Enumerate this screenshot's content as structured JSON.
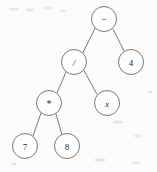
{
  "figure": {
    "name": "expression-tree",
    "type": "binary-expression-tree",
    "expression": "7 * 8 / x - 4",
    "width": 157,
    "height": 172,
    "background_color": "#fbfbfa",
    "stroke_color": "#6b6b6b",
    "text_color": "#2b2b2b",
    "node_fill": "#fdfdfc",
    "node_radius": 12.5
  },
  "nodes": [
    {
      "id": "n0",
      "label": "−",
      "kind": "operator",
      "style": "op",
      "cx": 104,
      "cy": 19,
      "r": 12.5
    },
    {
      "id": "n1",
      "label": "/",
      "kind": "operator",
      "style": "italic",
      "cx": 74,
      "cy": 62,
      "r": 12.5
    },
    {
      "id": "n2",
      "label": "4",
      "kind": "operand",
      "style": "plain",
      "cx": 131,
      "cy": 62,
      "r": 12.5
    },
    {
      "id": "n3",
      "label": "*",
      "kind": "operator",
      "style": "op",
      "cx": 49,
      "cy": 103,
      "r": 12.5
    },
    {
      "id": "n4",
      "label": "x",
      "kind": "variable",
      "style": "italic",
      "cx": 107,
      "cy": 103,
      "r": 12.5
    },
    {
      "id": "n5",
      "label": "7",
      "kind": "operand",
      "style": "plain",
      "cx": 25,
      "cy": 146,
      "r": 12.5
    },
    {
      "id": "n6",
      "label": "8",
      "kind": "operand",
      "style": "plain",
      "cx": 67,
      "cy": 146,
      "r": 12.5
    }
  ],
  "edges": [
    {
      "id": "e0",
      "from": "n0",
      "to": "n1",
      "x1": 95.5,
      "y1": 27.5,
      "x2": 82.5,
      "y2": 53.5
    },
    {
      "id": "e1",
      "from": "n0",
      "to": "n2",
      "x1": 113,
      "y1": 29,
      "x2": 124,
      "y2": 51
    },
    {
      "id": "e2",
      "from": "n1",
      "to": "n3",
      "x1": 66,
      "y1": 72,
      "x2": 57,
      "y2": 93
    },
    {
      "id": "e3",
      "from": "n1",
      "to": "n4",
      "x1": 84,
      "y1": 70.5,
      "x2": 97,
      "y2": 94.5
    },
    {
      "id": "e4",
      "from": "n3",
      "to": "n5",
      "x1": 41,
      "y1": 113,
      "x2": 33,
      "y2": 136
    },
    {
      "id": "e5",
      "from": "n3",
      "to": "n6",
      "x1": 56,
      "y1": 114,
      "x2": 62,
      "y2": 135
    }
  ],
  "specks": [
    {
      "cx": 14,
      "cy": 9,
      "rx": 5,
      "ry": 1.6
    },
    {
      "cx": 30,
      "cy": 10,
      "rx": 4,
      "ry": 1.4
    },
    {
      "cx": 48,
      "cy": 8,
      "rx": 3.5,
      "ry": 1.2
    },
    {
      "cx": 63,
      "cy": 11,
      "rx": 3,
      "ry": 1.2
    },
    {
      "cx": 118,
      "cy": 122,
      "rx": 5,
      "ry": 1.6
    },
    {
      "cx": 138,
      "cy": 136,
      "rx": 4,
      "ry": 1.4
    },
    {
      "cx": 100,
      "cy": 160,
      "rx": 6,
      "ry": 1.6
    },
    {
      "cx": 136,
      "cy": 163,
      "rx": 4,
      "ry": 1.3
    },
    {
      "cx": 14,
      "cy": 164,
      "rx": 3,
      "ry": 1.2
    },
    {
      "cx": 150,
      "cy": 92,
      "rx": 2.5,
      "ry": 1.2
    }
  ]
}
